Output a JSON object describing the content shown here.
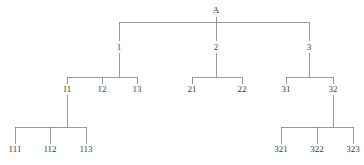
{
  "diagram": {
    "type": "tree",
    "title": "",
    "canvas": {
      "width": 364,
      "height": 165
    },
    "style": {
      "line_color": "#808080",
      "line_width": 0.8,
      "text_color": "#3c3c3c",
      "background": "#ffffff",
      "font_size_px": 9
    },
    "nodes": [
      {
        "id": "A",
        "label": "A",
        "x": 216,
        "y": 10,
        "level": 0,
        "parent": null
      },
      {
        "id": "1",
        "label": "1",
        "x": 119,
        "y": 47,
        "level": 1,
        "parent": "A"
      },
      {
        "id": "2",
        "label": "2",
        "x": 216,
        "y": 47,
        "level": 1,
        "parent": "A"
      },
      {
        "id": "3",
        "label": "3",
        "x": 309,
        "y": 47,
        "level": 1,
        "parent": "A"
      },
      {
        "id": "11",
        "label": "11",
        "x": 67,
        "y": 89,
        "level": 2,
        "parent": "1"
      },
      {
        "id": "12",
        "label": "12",
        "x": 102,
        "y": 89,
        "level": 2,
        "parent": "1"
      },
      {
        "id": "13",
        "label": "13",
        "x": 137,
        "y": 89,
        "level": 2,
        "parent": "1"
      },
      {
        "id": "21",
        "label": "21",
        "x": 192,
        "y": 89,
        "level": 2,
        "parent": "2"
      },
      {
        "id": "22",
        "label": "22",
        "x": 242,
        "y": 89,
        "level": 2,
        "parent": "2"
      },
      {
        "id": "31",
        "label": "31",
        "x": 286,
        "y": 89,
        "level": 2,
        "parent": "3"
      },
      {
        "id": "32",
        "label": "32",
        "x": 333,
        "y": 89,
        "level": 2,
        "parent": "3"
      },
      {
        "id": "111",
        "label": "111",
        "x": 15,
        "y": 149,
        "level": 3,
        "parent": "11"
      },
      {
        "id": "112",
        "label": "112",
        "x": 50,
        "y": 149,
        "level": 3,
        "parent": "11"
      },
      {
        "id": "113",
        "label": "113",
        "x": 86,
        "y": 149,
        "level": 3,
        "parent": "11"
      },
      {
        "id": "321",
        "label": "321",
        "x": 281,
        "y": 149,
        "level": 3,
        "parent": "32"
      },
      {
        "id": "322",
        "label": "322",
        "x": 317,
        "y": 149,
        "level": 3,
        "parent": "32"
      },
      {
        "id": "323",
        "label": "323",
        "x": 353,
        "y": 149,
        "level": 3,
        "parent": "32"
      }
    ],
    "connectors": [
      {
        "name": "root-to-level1",
        "parent": "A",
        "bus_y": 22,
        "parent_stub_x": 216,
        "parent_stub_from_y": 17,
        "children_x": [
          119,
          216,
          309
        ],
        "children_to_y": 41
      },
      {
        "name": "node1-to-children",
        "parent": "1",
        "bus_y": 77,
        "parent_stub_x": 119,
        "parent_stub_from_y": 53,
        "children_x": [
          67,
          102,
          137
        ],
        "children_to_y": 84
      },
      {
        "name": "node2-to-children",
        "parent": "2",
        "bus_y": 77,
        "parent_stub_x": 216,
        "parent_stub_from_y": 53,
        "children_x": [
          192,
          242
        ],
        "children_to_y": 84
      },
      {
        "name": "node3-to-children",
        "parent": "3",
        "bus_y": 77,
        "parent_stub_x": 309,
        "parent_stub_from_y": 53,
        "children_x": [
          286,
          333
        ],
        "children_to_y": 84
      },
      {
        "name": "node11-to-children",
        "parent": "11",
        "bus_y": 127,
        "parent_stub_x": 67,
        "parent_stub_from_y": 95,
        "children_x": [
          15,
          50,
          86
        ],
        "children_to_y": 144
      },
      {
        "name": "node32-to-children",
        "parent": "32",
        "bus_y": 127,
        "parent_stub_x": 333,
        "parent_stub_from_y": 95,
        "children_x": [
          281,
          317,
          353
        ],
        "children_to_y": 144
      }
    ]
  }
}
